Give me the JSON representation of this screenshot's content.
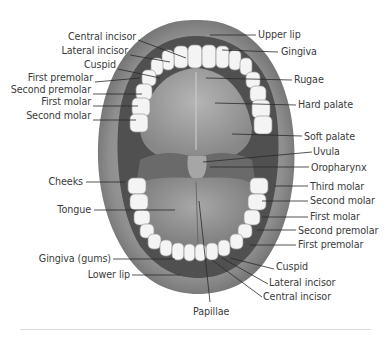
{
  "figure": {
    "colors": {
      "background": "#ffffff",
      "label_text": "#3c3c3c",
      "leader_line": "#2a2a2a",
      "lip": "#8e8e8e",
      "cavity_dark": "#4a4a4a",
      "palate": "#9a9a9a",
      "tongue": "#888888",
      "teeth": "#f4f4f4",
      "divider": "#dadada"
    },
    "labels_left_upper": [
      {
        "text": "Central incisor",
        "x": 138,
        "y": 36
      },
      {
        "text": "Lateral incisor",
        "x": 130,
        "y": 51
      },
      {
        "text": "Cuspid",
        "x": 118,
        "y": 65
      },
      {
        "text": "First premolar",
        "x": 95,
        "y": 78
      },
      {
        "text": "Second premolar",
        "x": 93,
        "y": 90
      },
      {
        "text": "First molar",
        "x": 93,
        "y": 102
      },
      {
        "text": "Second molar",
        "x": 93,
        "y": 116
      }
    ],
    "labels_right_upper": [
      {
        "text": "Upper lip",
        "x": 258,
        "y": 35
      },
      {
        "text": "Gingiva",
        "x": 280,
        "y": 52
      },
      {
        "text": "Rugae",
        "x": 293,
        "y": 80
      },
      {
        "text": "Hard palate",
        "x": 298,
        "y": 105
      }
    ],
    "labels_right_lower": [
      {
        "text": "Soft palate",
        "x": 305,
        "y": 136
      },
      {
        "text": "Uvula",
        "x": 313,
        "y": 152
      },
      {
        "text": "Oropharynx",
        "x": 311,
        "y": 167
      },
      {
        "text": "Third molar",
        "x": 310,
        "y": 186
      },
      {
        "text": "Second molar",
        "x": 310,
        "y": 201
      },
      {
        "text": "First molar",
        "x": 310,
        "y": 217
      },
      {
        "text": "Second premolar",
        "x": 298,
        "y": 230
      },
      {
        "text": "First premolar",
        "x": 298,
        "y": 245
      }
    ],
    "labels_left_lower": [
      {
        "text": "Cheeks",
        "x": 85,
        "y": 182
      },
      {
        "text": "Tongue",
        "x": 93,
        "y": 210
      },
      {
        "text": "Gingiva (gums)",
        "x": 112,
        "y": 259
      },
      {
        "text": "Lower lip",
        "x": 131,
        "y": 275
      }
    ],
    "labels_bottom": [
      {
        "text": "Cuspid",
        "x": 275,
        "y": 266
      },
      {
        "text": "Lateral incisor",
        "x": 268,
        "y": 282
      },
      {
        "text": "Central incisor",
        "x": 263,
        "y": 296
      },
      {
        "text": "Papillae",
        "x": 193,
        "y": 310
      }
    ]
  }
}
